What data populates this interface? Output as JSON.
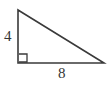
{
  "figure": {
    "kind": "right-triangle-diagram",
    "background_color": "#ffffff",
    "stroke_color": "#3a3a3a",
    "label_color": "#353535",
    "stroke_width": 1.6,
    "canvas": {
      "width": 108,
      "height": 87
    },
    "vertices": {
      "apex": {
        "x": 18,
        "y": 10
      },
      "right_angle": {
        "x": 18,
        "y": 63
      },
      "base_right": {
        "x": 104,
        "y": 63
      }
    },
    "right_angle_marker": {
      "name": "right-angle-square",
      "x": 19,
      "y": 54,
      "size": 8,
      "visible": true
    },
    "labels": {
      "vertical_leg": "4",
      "horizontal_leg": "8"
    },
    "measurements": {
      "leg_vertical_value": 4,
      "leg_horizontal_value": 8
    }
  },
  "chart_data": {
    "type": "diagram",
    "title": "",
    "shape": "right triangle",
    "categories": [
      "vertical leg",
      "horizontal leg"
    ],
    "values": [
      4,
      8
    ],
    "labels": [
      "4",
      "8"
    ],
    "annotations": [
      "right angle at bottom-left vertex"
    ]
  }
}
